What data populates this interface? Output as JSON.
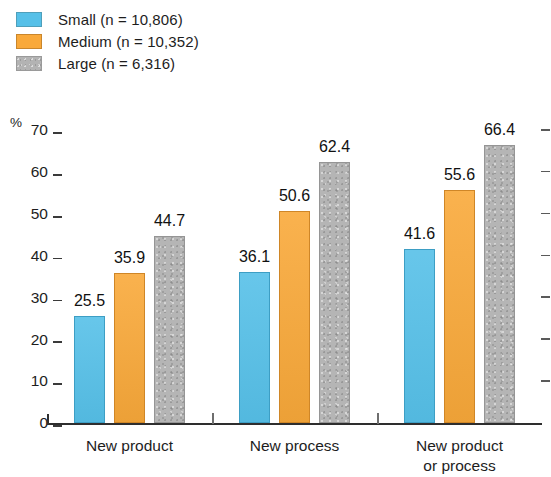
{
  "chart_data": {
    "type": "bar",
    "title": "",
    "subtitle": "",
    "xlabel": "",
    "ylabel": "%",
    "ylim": [
      0,
      70
    ],
    "yticks": [
      0,
      10,
      20,
      30,
      40,
      50,
      60,
      70
    ],
    "ytick_labels": [
      "0",
      "10",
      "20",
      "30",
      "40",
      "50",
      "60",
      "70"
    ],
    "grid": false,
    "legend_position": "top-left",
    "categories": [
      "New product",
      "New process",
      "New product or process"
    ],
    "category_lines": [
      [
        "New product"
      ],
      [
        "New process"
      ],
      [
        "New product",
        "or process"
      ]
    ],
    "series": [
      {
        "name": "Small (n = 10,806)",
        "short": "Small",
        "color": "#56c0e8",
        "values": [
          25.5,
          36.1,
          41.6
        ],
        "labels": [
          "25.5",
          "36.1",
          "41.6"
        ]
      },
      {
        "name": "Medium (n = 10,352)",
        "short": "Medium",
        "color": "#f9a93a",
        "values": [
          35.9,
          50.6,
          55.6
        ],
        "labels": [
          "35.9",
          "50.6",
          "55.6"
        ]
      },
      {
        "name": "Large (n = 6,316)",
        "short": "Large",
        "color": "#b5b5b5",
        "values": [
          44.7,
          62.4,
          66.4
        ],
        "labels": [
          "44.7",
          "62.4",
          "66.4"
        ]
      }
    ]
  },
  "legend": {
    "items": [
      {
        "label": "Small (n = 10,806)",
        "swatch": "sw-small"
      },
      {
        "label": "Medium (n = 10,352)",
        "swatch": "sw-medium"
      },
      {
        "label": "Large (n = 6,316)",
        "swatch": "sw-large"
      }
    ]
  },
  "axis": {
    "unit_label": "%"
  }
}
